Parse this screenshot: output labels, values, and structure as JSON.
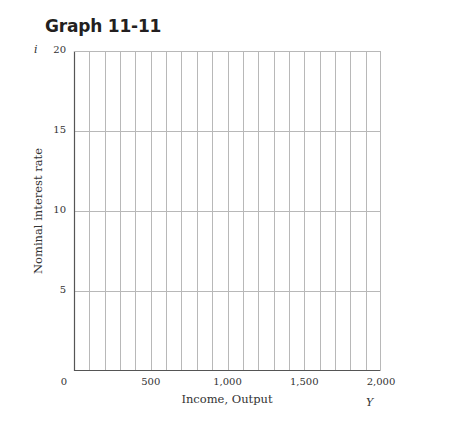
{
  "title": "Graph 11-11",
  "chart_data": {
    "type": "line",
    "title": "Graph 11-11",
    "xlabel": "Income, Output",
    "ylabel": "Nominal interest rate",
    "x_symbol": "Y",
    "y_symbol": "i",
    "xlim": [
      0,
      2000
    ],
    "ylim": [
      0,
      20
    ],
    "x_ticks": [
      0,
      500,
      1000,
      1500,
      2000
    ],
    "x_tick_labels": [
      "0",
      "500",
      "1,000",
      "1,500",
      "2,000"
    ],
    "y_ticks": [
      5,
      10,
      15,
      20
    ],
    "y_tick_labels": [
      "5",
      "10",
      "15",
      "20"
    ],
    "x_grid_step": 100,
    "y_grid_step": 5,
    "grid": true,
    "series": []
  },
  "colors": {
    "grid": "#b8b8b8",
    "axis": "#555555",
    "text": "#333333",
    "title": "#231f20"
  }
}
